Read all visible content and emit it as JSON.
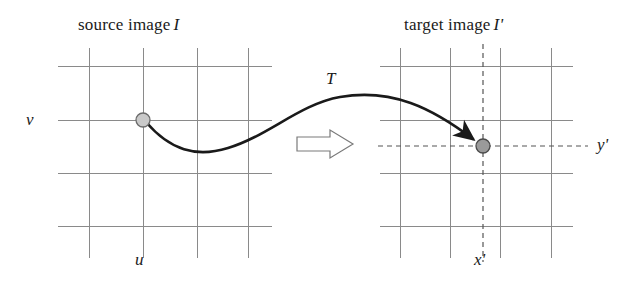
{
  "figure": {
    "kind": "diagram",
    "background_color": "#ffffff",
    "width": 640,
    "height": 290
  },
  "panels": {
    "source": {
      "title": "source image",
      "title_symbol": "I",
      "horizontal_axis_label": "u",
      "vertical_axis_label": "v",
      "grid": {
        "vertical_lines_x": [
          89,
          143,
          197,
          248
        ],
        "horizontal_lines_y": [
          66,
          120,
          173,
          226
        ],
        "vertical_extent_y": [
          48,
          258
        ],
        "horizontal_extent_x": [
          58,
          272
        ],
        "line_color": "#8a8a8a",
        "line_width": 1
      },
      "marker": {
        "name": "source-point",
        "x": 143,
        "y": 120,
        "radius": 7,
        "fill_color": "#c9c9c9",
        "stroke_color": "#6b6b6b"
      }
    },
    "target": {
      "title": "target image",
      "title_symbol": "I'",
      "horizontal_axis_label": "x'",
      "vertical_axis_label": "y'",
      "grid": {
        "vertical_lines_x": [
          400,
          450,
          500,
          551
        ],
        "horizontal_lines_y": [
          66,
          120,
          173,
          226
        ],
        "vertical_extent_y": [
          48,
          258
        ],
        "horizontal_extent_x": [
          380,
          573
        ],
        "line_color": "#8a8a8a",
        "line_width": 1
      },
      "dashed_guides": {
        "vertical_x": 483,
        "vertical_extent_y": [
          44,
          262
        ],
        "horizontal_y": 146,
        "horizontal_extent_x": [
          378,
          588
        ],
        "color": "#555555",
        "dash_pattern": "5 4"
      },
      "marker": {
        "name": "target-point",
        "x": 483,
        "y": 146,
        "radius": 7,
        "fill_color": "#9a9a9a",
        "stroke_color": "#4a4a4a"
      }
    }
  },
  "mapping": {
    "label": "T",
    "label_x": 330,
    "label_y": 78,
    "curve_color": "#1a1a1a",
    "curve_width": 2.6,
    "path_description": "S-shaped curve from source point to target point with arrowhead",
    "block_arrow": {
      "name": "block-arrow",
      "direction": "right",
      "x": 297,
      "y": 130,
      "width": 56,
      "height": 28,
      "fill_color": "#ffffff",
      "stroke_color": "#6b6b6b"
    }
  },
  "labels": {
    "source_title_x": 78,
    "source_title_y": 16,
    "target_title_x": 404,
    "target_title_y": 16,
    "v_x": 26,
    "v_y": 111,
    "u_x": 135,
    "u_y": 258,
    "xprime_x": 474,
    "xprime_y": 258,
    "yprime_x": 597,
    "yprime_y": 136
  }
}
